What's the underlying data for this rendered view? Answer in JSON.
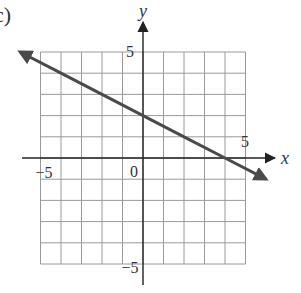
{
  "problem_label": "c)",
  "chart_data": {
    "type": "line",
    "title": "",
    "xlabel": "x",
    "ylabel": "y",
    "xlim": [
      -5,
      5
    ],
    "ylim": [
      -5,
      5
    ],
    "grid": true,
    "tick_labels": {
      "x": [
        "-5",
        "5"
      ],
      "y": [
        "5",
        "-5"
      ],
      "origin": "0"
    },
    "series": [
      {
        "name": "line",
        "equation": "y = -0.5x + 2",
        "slope": -0.5,
        "y_intercept": 2,
        "x_intercept": 4,
        "x": [
          -6,
          -4,
          -2,
          0,
          2,
          4,
          6
        ],
        "values": [
          5,
          4,
          3,
          2,
          1,
          0,
          -1
        ],
        "arrows": "both",
        "color": "#4a4a4a"
      }
    ]
  }
}
